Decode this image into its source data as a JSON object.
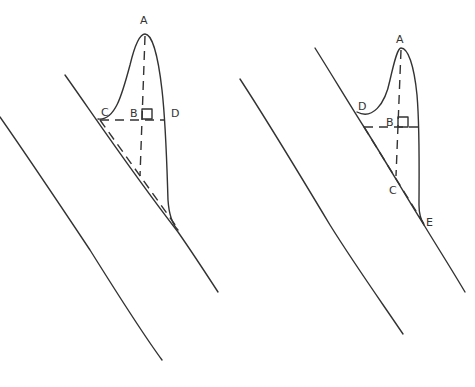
{
  "figures": [
    {
      "name": "left-figure",
      "labels": {
        "A": "A",
        "B": "B",
        "C": "C",
        "D": "D"
      }
    },
    {
      "name": "right-figure",
      "labels": {
        "A": "A",
        "B": "B",
        "C": "C",
        "D": "D",
        "E": "E"
      }
    }
  ],
  "colors": {
    "stroke": "#333333",
    "background": "#ffffff"
  }
}
